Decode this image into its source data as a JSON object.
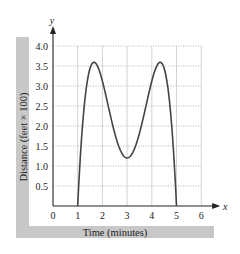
{
  "chart_data": {
    "type": "line",
    "title": "",
    "xlabel": "Time (minutes)",
    "ylabel": "Distance (feet × 100)",
    "x_axis_name": "x",
    "y_axis_name": "y",
    "xlim": [
      0,
      6
    ],
    "ylim": [
      0,
      4.0
    ],
    "x_ticks": [
      "0",
      "1",
      "2",
      "3",
      "4",
      "5",
      "6"
    ],
    "y_ticks": [
      "0.5",
      "1.0",
      "1.5",
      "2.0",
      "2.5",
      "3.0",
      "3.5",
      "4.0"
    ],
    "grid": true,
    "legend": null,
    "series": [
      {
        "name": "distance",
        "x": [
          1.0,
          1.2,
          1.4,
          1.66,
          2.0,
          2.5,
          3.0,
          3.5,
          4.0,
          4.34,
          4.6,
          4.8,
          5.0
        ],
        "y": [
          0.0,
          1.86,
          3.05,
          3.6,
          3.2,
          1.7,
          1.2,
          1.7,
          3.2,
          3.6,
          3.05,
          1.86,
          0.0
        ]
      }
    ],
    "annotations": {
      "maxima": [
        {
          "x": 1.66,
          "y": 3.6
        },
        {
          "x": 4.34,
          "y": 3.6
        }
      ],
      "minimum": {
        "x": 3.0,
        "y": 1.2
      },
      "zeros": [
        1,
        5
      ]
    }
  },
  "labels": {
    "xlabel": "Time (minutes)",
    "ylabel": "Distance (feet × 100)"
  },
  "colors": {
    "curve": "#444444",
    "grid": "#bbbbbb",
    "band": "#c8c8c8",
    "axis": "#222222"
  }
}
